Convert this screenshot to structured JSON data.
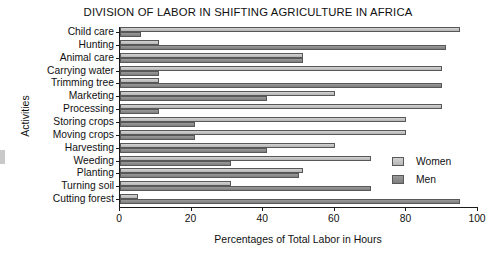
{
  "chart_data": {
    "type": "bar",
    "orientation": "horizontal",
    "title": "DIVISION OF LABOR IN SHIFTING AGRICULTURE IN AFRICA",
    "xlabel": "Percentages of Total Labor in Hours",
    "ylabel": "Activities",
    "xlim": [
      0,
      100
    ],
    "xticks": [
      0,
      20,
      40,
      60,
      80,
      100
    ],
    "grid": false,
    "legend_position": "right-middle",
    "categories": [
      "Child care",
      "Hunting",
      "Animal care",
      "Carrying water",
      "Trimming tree",
      "Marketing",
      "Processing",
      "Storing crops",
      "Moving crops",
      "Harvesting",
      "Weeding",
      "Planting",
      "Turning soil",
      "Cutting forest"
    ],
    "series": [
      {
        "name": "Women",
        "color": "#c3c3c3",
        "values": [
          95,
          11,
          51,
          90,
          11,
          60,
          90,
          80,
          80,
          60,
          70,
          51,
          31,
          5
        ]
      },
      {
        "name": "Men",
        "color": "#8b8b8b",
        "values": [
          6,
          91,
          51,
          11,
          90,
          41,
          11,
          21,
          21,
          41,
          31,
          50,
          70,
          95
        ]
      }
    ]
  },
  "legend": {
    "items": [
      {
        "label": "Women",
        "swatch": "women"
      },
      {
        "label": "Men",
        "swatch": "men"
      }
    ]
  },
  "xticklabels": [
    "0",
    "20",
    "40",
    "60",
    "80",
    "100"
  ]
}
